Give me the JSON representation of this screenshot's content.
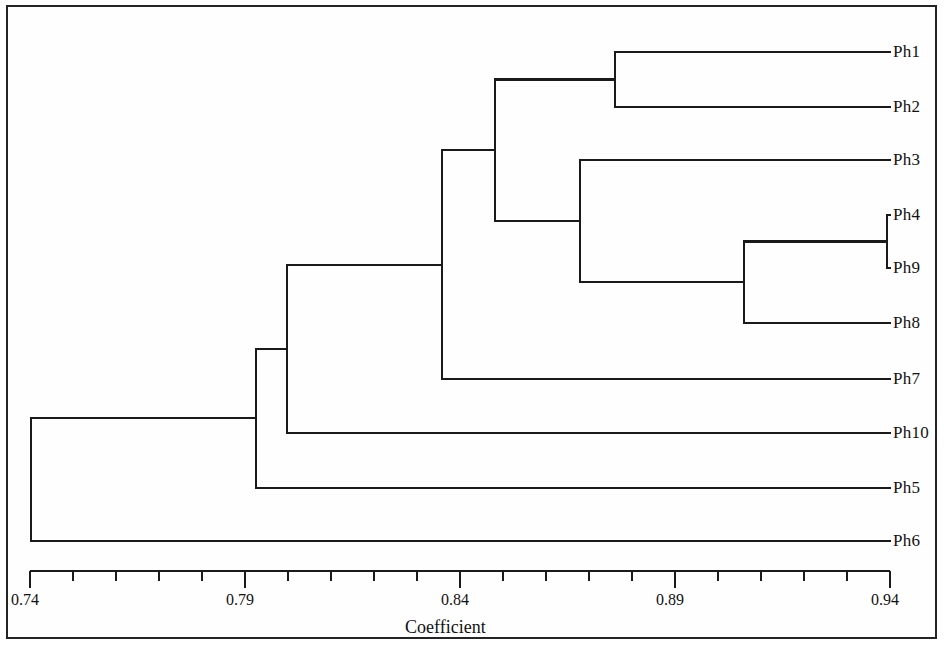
{
  "figure": {
    "width": 951,
    "height": 656,
    "background_color": "#ffffff",
    "line_color": "#1a1a1a",
    "border_color": "#242424"
  },
  "axis": {
    "title": "Coefficient",
    "min": 0.74,
    "max": 0.94,
    "tick_labels": [
      "0.74",
      "0.79",
      "0.84",
      "0.89",
      "0.94"
    ],
    "tick_values": [
      0.74,
      0.79,
      0.84,
      0.89,
      0.94
    ],
    "minor_tick_step": 0.01,
    "pixel_left": 30,
    "pixel_right": 890,
    "pixel_y": 571
  },
  "chart_data": {
    "type": "dendrogram",
    "title": "",
    "xlabel": "Coefficient",
    "ylabel": "",
    "xlim": [
      0.74,
      0.94
    ],
    "grid": false,
    "legend": null,
    "orientation": "horizontal-right-to-left",
    "similarity_axis": true,
    "leaves": [
      {
        "label": "Ph1",
        "order": 1,
        "y": 52
      },
      {
        "label": "Ph2",
        "order": 2,
        "y": 107
      },
      {
        "label": "Ph3",
        "order": 3,
        "y": 160
      },
      {
        "label": "Ph4",
        "order": 4,
        "y": 215
      },
      {
        "label": "Ph9",
        "order": 5,
        "y": 268
      },
      {
        "label": "Ph8",
        "order": 6,
        "y": 323
      },
      {
        "label": "Ph7",
        "order": 7,
        "y": 379
      },
      {
        "label": "Ph10",
        "order": 8,
        "y": 433
      },
      {
        "label": "Ph5",
        "order": 9,
        "y": 488
      },
      {
        "label": "Ph6",
        "order": 10,
        "y": 541
      }
    ],
    "merges": [
      {
        "id": "n1",
        "members": [
          "Ph4",
          "Ph9"
        ],
        "coefficient": 0.939,
        "x": 887,
        "y_top": 215,
        "y_bottom": 268,
        "y_mid": 241.5
      },
      {
        "id": "n2",
        "members": [
          "Ph4",
          "Ph9",
          "Ph8"
        ],
        "coefficient": 0.906,
        "x": 744,
        "y_top": 241.5,
        "y_bottom": 323,
        "y_mid": 282.2
      },
      {
        "id": "n3",
        "members": [
          "Ph1",
          "Ph2"
        ],
        "coefficient": 0.876,
        "x": 615,
        "y_top": 52,
        "y_bottom": 107,
        "y_mid": 79.5
      },
      {
        "id": "n4",
        "members": [
          "Ph3",
          "Ph4",
          "Ph9",
          "Ph8"
        ],
        "coefficient": 0.868,
        "x": 580,
        "y_top": 160,
        "y_bottom": 282.2,
        "y_mid": 221.1
      },
      {
        "id": "n5",
        "members": [
          "Ph1",
          "Ph2",
          "Ph3",
          "Ph4",
          "Ph9",
          "Ph8"
        ],
        "coefficient": 0.848,
        "x": 495,
        "y_top": 79.5,
        "y_bottom": 221.1,
        "y_mid": 150.3
      },
      {
        "id": "n6",
        "members": [
          "Ph1",
          "Ph2",
          "Ph3",
          "Ph4",
          "Ph9",
          "Ph8",
          "Ph7"
        ],
        "coefficient": 0.836,
        "x": 442,
        "y_top": 150.3,
        "y_bottom": 379,
        "y_mid": 264.6
      },
      {
        "id": "n7",
        "members": [
          "Ph1",
          "Ph2",
          "Ph3",
          "Ph4",
          "Ph9",
          "Ph8",
          "Ph7",
          "Ph10"
        ],
        "coefficient": 0.8,
        "x": 287,
        "y_top": 264.6,
        "y_bottom": 433,
        "y_mid": 348.8
      },
      {
        "id": "n8",
        "members": [
          "Ph1",
          "Ph2",
          "Ph3",
          "Ph4",
          "Ph9",
          "Ph8",
          "Ph7",
          "Ph10",
          "Ph5"
        ],
        "coefficient": 0.793,
        "x": 256,
        "y_top": 348.8,
        "y_bottom": 488,
        "y_mid": 418.4
      },
      {
        "id": "n9",
        "members": [
          "Ph1",
          "Ph2",
          "Ph3",
          "Ph4",
          "Ph9",
          "Ph8",
          "Ph7",
          "Ph10",
          "Ph5",
          "Ph6"
        ],
        "coefficient": 0.74,
        "x": 31,
        "y_top": 418.4,
        "y_bottom": 541,
        "y_mid": 479.7
      }
    ]
  }
}
